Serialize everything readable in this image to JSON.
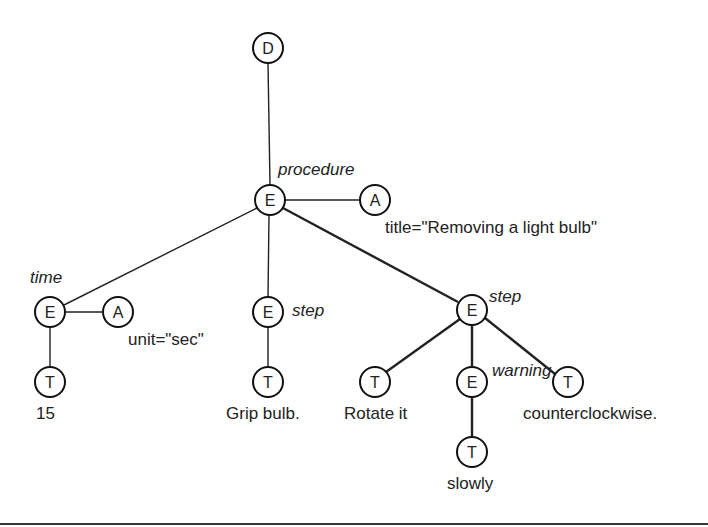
{
  "diagram": {
    "nodes": [
      {
        "id": "d",
        "type": "D",
        "x": 268,
        "y": 48
      },
      {
        "id": "proc",
        "type": "E",
        "x": 270,
        "y": 200,
        "name": "procedure"
      },
      {
        "id": "a_title",
        "type": "A",
        "x": 375,
        "y": 200,
        "value": "title=\"Removing a light bulb\""
      },
      {
        "id": "time",
        "type": "E",
        "x": 50,
        "y": 312,
        "name": "time"
      },
      {
        "id": "a_unit",
        "type": "A",
        "x": 118,
        "y": 312,
        "value": "unit=\"sec\""
      },
      {
        "id": "t15",
        "type": "T",
        "x": 50,
        "y": 382,
        "value": "15"
      },
      {
        "id": "step1",
        "type": "E",
        "x": 268,
        "y": 312,
        "name": "step"
      },
      {
        "id": "tgrip",
        "type": "T",
        "x": 268,
        "y": 382,
        "value": "Grip bulb."
      },
      {
        "id": "step2",
        "type": "E",
        "x": 472,
        "y": 310,
        "name": "step"
      },
      {
        "id": "trot",
        "type": "T",
        "x": 375,
        "y": 382,
        "value": "Rotate it"
      },
      {
        "id": "warn",
        "type": "E",
        "x": 472,
        "y": 382,
        "name": "warning"
      },
      {
        "id": "tcounter",
        "type": "T",
        "x": 568,
        "y": 382,
        "value": "counterclockwise."
      },
      {
        "id": "tslow",
        "type": "T",
        "x": 472,
        "y": 452,
        "value": "slowly"
      }
    ],
    "labels": {
      "procedure": "procedure",
      "title_attr": "title=\"Removing a light bulb\"",
      "time": "time",
      "unit_attr": "unit=\"sec\"",
      "t15": "15",
      "step1": "step",
      "grip": "Grip bulb.",
      "step2": "step",
      "rotate": "Rotate it",
      "warning": "warning",
      "counter": "counterclockwise.",
      "slowly": "slowly"
    }
  }
}
